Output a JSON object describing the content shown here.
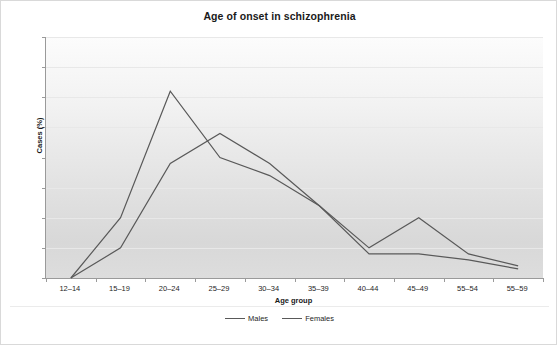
{
  "chart_data": {
    "type": "line",
    "title": "Age of onset in schizophrenia",
    "xlabel": "Age group",
    "ylabel": "Cases (%)",
    "categories": [
      "12–14",
      "15–19",
      "20–24",
      "25–29",
      "30–34",
      "35–39",
      "40–44",
      "45–49",
      "55–54",
      "55–59"
    ],
    "series": [
      {
        "name": "Males",
        "values": [
          0,
          10,
          31,
          20,
          17,
          12,
          4,
          4,
          3,
          1.5
        ],
        "color": "#595959"
      },
      {
        "name": "Females",
        "values": [
          0,
          5,
          19,
          24,
          19,
          12,
          5,
          10,
          4,
          2
        ],
        "color": "#595959"
      }
    ],
    "ylim": [
      0,
      40
    ],
    "yticks": [
      0,
      5,
      10,
      15,
      20,
      25,
      30,
      35,
      40
    ],
    "ytick_labels": [
      "0",
      "5",
      "10",
      "15",
      "20",
      "25",
      "30",
      "35",
      "40"
    ],
    "grid": true,
    "legend_position": "bottom",
    "legend_entries": [
      "Males",
      "Females"
    ]
  },
  "colors": {
    "line": "#595959",
    "axis": "#9a9a9a",
    "grid": "#e8e8e8",
    "text": "#262626",
    "frame_border": "#d9d9d9"
  }
}
